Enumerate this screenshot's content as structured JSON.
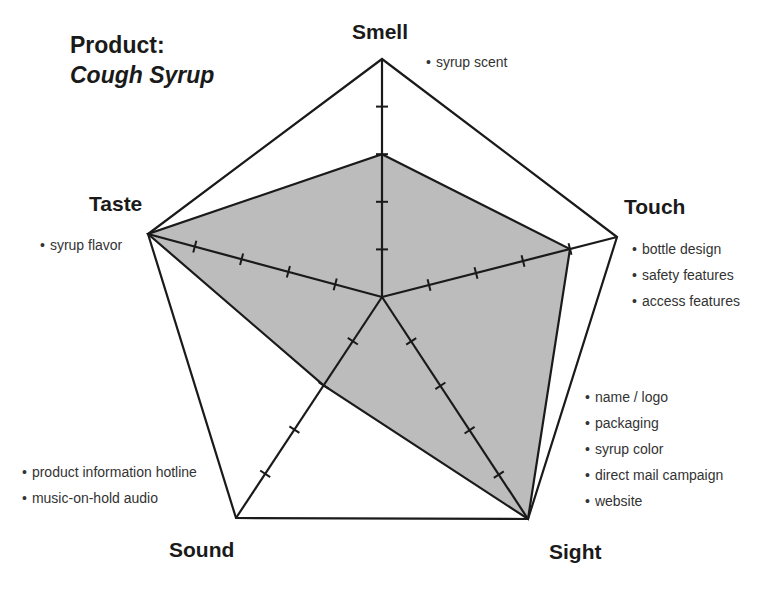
{
  "title": {
    "prefix": "Product:",
    "product": "Cough Syrup"
  },
  "style": {
    "fill_color": "#bcbcbc",
    "line_color": "#1a1a1a"
  },
  "chart_data": {
    "type": "radar",
    "title": "Product: Cough Syrup",
    "scale": {
      "min": 0,
      "max": 5,
      "ticks": [
        1,
        2,
        3,
        4,
        5
      ]
    },
    "categories": [
      "Smell",
      "Touch",
      "Sight",
      "Sound",
      "Taste"
    ],
    "values": [
      3,
      4,
      5,
      2,
      5
    ],
    "annotations": {
      "Smell": [
        "syrup scent"
      ],
      "Touch": [
        "bottle design",
        "safety features",
        "access features"
      ],
      "Sight": [
        "name / logo",
        "packaging",
        "syrup color",
        "direct mail campaign",
        "website"
      ],
      "Sound": [
        "product information hotline",
        "music-on-hold audio"
      ],
      "Taste": [
        "syrup flavor"
      ]
    },
    "legend": "none",
    "grid": false
  },
  "axes": {
    "smell": {
      "label": "Smell",
      "notes": [
        "syrup scent"
      ]
    },
    "touch": {
      "label": "Touch",
      "notes": [
        "bottle design",
        "safety features",
        "access features"
      ]
    },
    "sight": {
      "label": "Sight",
      "notes": [
        "name / logo",
        "packaging",
        "syrup color",
        "direct mail campaign",
        "website"
      ]
    },
    "sound": {
      "label": "Sound",
      "notes": [
        "product information hotline",
        "music-on-hold audio"
      ]
    },
    "taste": {
      "label": "Taste",
      "notes": [
        "syrup flavor"
      ]
    }
  }
}
